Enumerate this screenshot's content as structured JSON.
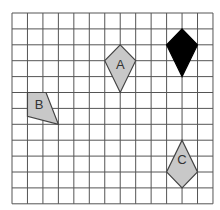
{
  "grid": {
    "columns": 13,
    "rows": 12,
    "origin_px": [
      12,
      13
    ],
    "cell_w": 15.46,
    "cell_h": 15.9,
    "line_color": "#555555",
    "background": "#ffffff"
  },
  "shapes": [
    {
      "id": "black",
      "label": "",
      "fill": "#000000",
      "stroke": "#000000",
      "points": [
        [
          11,
          1
        ],
        [
          12,
          2
        ],
        [
          11,
          4
        ],
        [
          10,
          2
        ]
      ]
    },
    {
      "id": "A",
      "label": "A",
      "fill": "#c8c8c8",
      "stroke": "#444444",
      "points": [
        [
          7,
          2
        ],
        [
          8,
          3
        ],
        [
          7,
          5
        ],
        [
          6,
          3
        ]
      ],
      "label_pos": [
        7,
        3.3
      ]
    },
    {
      "id": "B",
      "label": "B",
      "fill": "#c8c8c8",
      "stroke": "#444444",
      "points": [
        [
          1,
          5
        ],
        [
          2.2,
          5
        ],
        [
          3,
          7
        ],
        [
          1,
          6.5
        ]
      ],
      "label_pos": [
        1.75,
        5.8
      ]
    },
    {
      "id": "C",
      "label": "C",
      "fill": "#c8c8c8",
      "stroke": "#444444",
      "points": [
        [
          11,
          8
        ],
        [
          12,
          10
        ],
        [
          11,
          11
        ],
        [
          10,
          10
        ]
      ],
      "label_pos": [
        11,
        9.3
      ]
    }
  ],
  "labels": {
    "A": "A",
    "B": "B",
    "C": "C"
  }
}
